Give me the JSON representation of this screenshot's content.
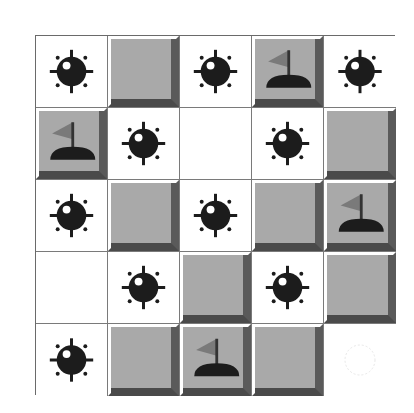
{
  "board": {
    "rows": 5,
    "cols": 5,
    "cells": [
      [
        "mine",
        "covered",
        "mine",
        "flag",
        "mine"
      ],
      [
        "flag",
        "mine",
        "empty",
        "mine",
        "covered"
      ],
      [
        "mine",
        "covered",
        "mine",
        "covered",
        "flag"
      ],
      [
        "empty",
        "mine",
        "covered",
        "mine",
        "covered"
      ],
      [
        "mine",
        "covered",
        "flag",
        "covered",
        "mine-faint"
      ]
    ]
  },
  "colors": {
    "mine": "#1c1c1c",
    "tile_face": "#a9a9a9",
    "tile_shadow": "#4a4a4a",
    "flag": "#7a7a7a",
    "grid_line": "#7a7a7a"
  }
}
